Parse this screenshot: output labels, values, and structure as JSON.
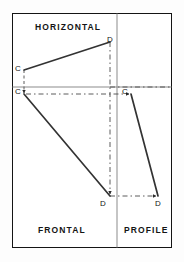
{
  "diagram": {
    "type": "multiview-projection",
    "frame": {
      "x": 12,
      "y": 13,
      "width": 160,
      "height": 235
    },
    "colors": {
      "border": "#141414",
      "fold_line": "#7a7a7a",
      "object_line": "#333333",
      "projection_line": "#4a4a4a",
      "background": "#ffffff",
      "text": "#141414"
    },
    "quadrant_labels": {
      "horizontal": "HORIZONTAL",
      "frontal": "FRONTAL",
      "profile": "PROFILE"
    },
    "fold_lines": {
      "horizontal_y": 87,
      "vertical_x": 117
    },
    "points": [
      {
        "id": "c-horizontal",
        "label": "C",
        "view": "horizontal",
        "x": 24,
        "y": 70
      },
      {
        "id": "d-horizontal",
        "label": "D",
        "view": "horizontal",
        "x": 110,
        "y": 42
      },
      {
        "id": "c-frontal",
        "label": "C",
        "view": "frontal",
        "x": 24,
        "y": 94
      },
      {
        "id": "d-frontal",
        "label": "D",
        "view": "frontal",
        "x": 110,
        "y": 196
      },
      {
        "id": "c-profile",
        "label": "C",
        "view": "profile",
        "x": 131,
        "y": 94
      },
      {
        "id": "d-profile",
        "label": "D",
        "view": "profile",
        "x": 158,
        "y": 196
      }
    ],
    "object_lines": [
      {
        "id": "cd-horizontal",
        "from": "c-horizontal",
        "to": "d-horizontal"
      },
      {
        "id": "cd-frontal",
        "from": "c-frontal",
        "to": "d-frontal"
      },
      {
        "id": "cd-profile",
        "from": "c-profile",
        "to": "d-profile"
      }
    ],
    "projection_lines": [
      {
        "id": "proj-c-down",
        "orientation": "vertical",
        "arrow": "down"
      },
      {
        "id": "proj-d-down",
        "orientation": "vertical",
        "arrow": "down"
      },
      {
        "id": "proj-c-right",
        "orientation": "horizontal",
        "arrow": "right"
      },
      {
        "id": "proj-d-right",
        "orientation": "horizontal",
        "arrow": "right"
      }
    ]
  }
}
